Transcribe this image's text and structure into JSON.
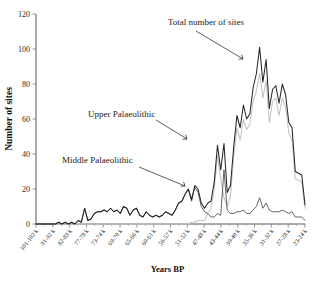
{
  "chart_data": {
    "type": "line",
    "title": "",
    "xlabel": "Years BP",
    "ylabel": "Number of sites",
    "ylim": [
      0,
      120
    ],
    "yticks": [
      0,
      20,
      40,
      60,
      80,
      100,
      120
    ],
    "grid": false,
    "legend_position": "inline-annotations",
    "annotations": [
      {
        "text": "Total number of sites",
        "series": "total"
      },
      {
        "text": "Upper Palaeolithic",
        "series": "upper"
      },
      {
        "text": "Middle Palaeolithic",
        "series": "middle"
      }
    ],
    "xtick_labels": [
      "101-102 k",
      "91-92 k",
      "82-83 k",
      "77-78 k",
      "73-74 k",
      "69-70 k",
      "65-66 k",
      "60-61 k",
      "56-57 k",
      "51-52 k",
      "47-48 k",
      "43-44 k",
      "39-40 k",
      "35-36 k",
      "31-32 k",
      "27-28 k",
      "23-24 k"
    ],
    "series": [
      {
        "name": "Total number of sites",
        "color": "#262626",
        "values": [
          0,
          0,
          0,
          0,
          0,
          0,
          0,
          1,
          0,
          1,
          0,
          1,
          0,
          2,
          1,
          9,
          2,
          3,
          6,
          7,
          7,
          8,
          7,
          9,
          7,
          8,
          6,
          10,
          9,
          5,
          8,
          9,
          5,
          4,
          7,
          5,
          4,
          5,
          4,
          5,
          7,
          6,
          5,
          8,
          12,
          13,
          17,
          20,
          14,
          22,
          20,
          12,
          9,
          12,
          13,
          24,
          45,
          31,
          46,
          18,
          22,
          44,
          62,
          55,
          68,
          60,
          63,
          78,
          86,
          101,
          81,
          94,
          66,
          77,
          79,
          69,
          80,
          74,
          58,
          55,
          30,
          29,
          28,
          11
        ]
      },
      {
        "name": "Upper Palaeolithic",
        "color": "#c3c3c3",
        "values": [
          0,
          0,
          0,
          0,
          0,
          0,
          0,
          0,
          0,
          0,
          0,
          0,
          0,
          0,
          0,
          0,
          0,
          0,
          0,
          0,
          0,
          0,
          0,
          0,
          0,
          0,
          0,
          0,
          0,
          0,
          0,
          0,
          0,
          0,
          0,
          0,
          0,
          0,
          0,
          0,
          0,
          0,
          0,
          0,
          0,
          0,
          0,
          0,
          1,
          1,
          2,
          2,
          2,
          6,
          9,
          20,
          39,
          26,
          15,
          10,
          16,
          38,
          55,
          48,
          60,
          54,
          57,
          70,
          76,
          86,
          72,
          82,
          58,
          70,
          72,
          62,
          72,
          67,
          52,
          48,
          26,
          25,
          24,
          9
        ]
      },
      {
        "name": "Middle Palaeolithic",
        "color": "#4a4a4a",
        "values": [
          0,
          0,
          0,
          0,
          0,
          0,
          0,
          1,
          0,
          1,
          0,
          1,
          0,
          2,
          1,
          9,
          2,
          3,
          6,
          7,
          7,
          8,
          7,
          9,
          7,
          8,
          6,
          10,
          9,
          5,
          8,
          9,
          5,
          4,
          7,
          5,
          4,
          5,
          4,
          5,
          7,
          6,
          5,
          8,
          12,
          13,
          17,
          20,
          13,
          21,
          18,
          10,
          7,
          6,
          4,
          4,
          6,
          5,
          31,
          8,
          6,
          6,
          7,
          7,
          8,
          6,
          6,
          8,
          10,
          15,
          9,
          12,
          8,
          7,
          7,
          7,
          8,
          7,
          6,
          7,
          4,
          4,
          4,
          2
        ]
      }
    ]
  }
}
